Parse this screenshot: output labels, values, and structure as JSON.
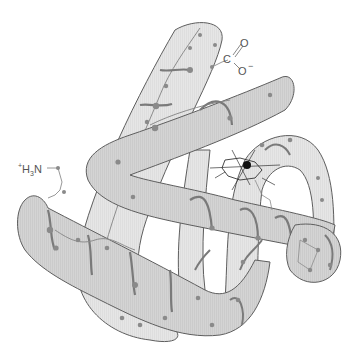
{
  "diagram": {
    "labels": {
      "n_terminus": {
        "charge": "+",
        "text_main": "H",
        "subscript": "3",
        "text_tail": "N"
      },
      "c_terminus": {
        "carbon": "C",
        "double_bond_oxygen": "O",
        "single_bond_oxygen": "O",
        "charge": "−"
      }
    },
    "elements": {
      "helices_count": 6,
      "heme_group": true,
      "iron_atom": true
    },
    "colors": {
      "tube_fill": "#d2d2d2",
      "tube_fill_light": "#e4e4e4",
      "tube_stroke": "#5e5e5e",
      "backbone": "#7a7a7a",
      "residue_dot": "#8a8a8a",
      "heme_lines": "#333333",
      "iron": "#111111",
      "label_text": "#555555"
    }
  }
}
